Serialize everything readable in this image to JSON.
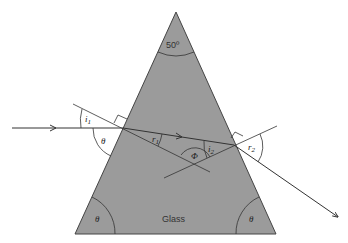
{
  "diagram": {
    "prism": {
      "material_label": "Glass",
      "apex_angle_label": "50º",
      "base_angle_left_label": "θ",
      "base_angle_right_label": "θ",
      "fill_color": "#9b9b9b"
    },
    "labels": {
      "i1": "i",
      "i1_sub": "1",
      "theta_incidence": "θ",
      "r1": "r",
      "r1_sub": "1",
      "phi": "Φ",
      "i2": "i",
      "i2_sub": "2",
      "r2": "r",
      "r2_sub": "2"
    },
    "rays": [
      "incident ray",
      "refracted ray inside glass",
      "emergent ray"
    ],
    "normals": [
      "normal at entry face",
      "normal at exit face"
    ]
  }
}
